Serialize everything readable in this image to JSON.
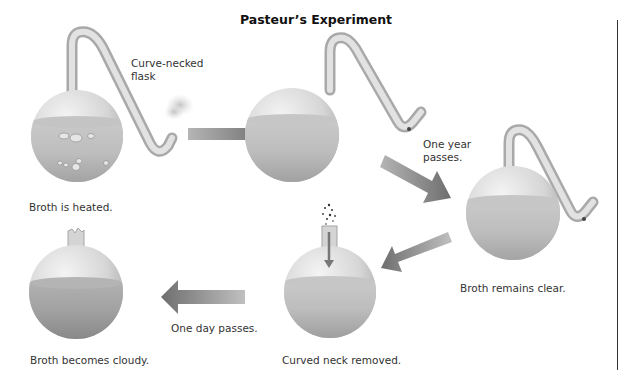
{
  "title": "Pasteur’s Experiment",
  "labels": {
    "curve_necked_1": "Curve-necked",
    "curve_necked_2": "flask",
    "broth_heated": "Broth is heated.",
    "one_year_1": "One year",
    "one_year_2": "passes.",
    "broth_clear": "Broth remains clear.",
    "neck_removed": "Curved neck removed.",
    "one_day": "One day passes.",
    "broth_cloudy": "Broth becomes cloudy."
  },
  "steps": [
    {
      "id": 1,
      "flask": "curve-necked, boiling",
      "caption": "Broth is heated."
    },
    {
      "id": 2,
      "flask": "curve-necked, clear",
      "caption": ""
    },
    {
      "id": 3,
      "flask": "curve-necked, clear",
      "caption": "Broth remains clear."
    },
    {
      "id": 4,
      "flask": "neck removed, clear",
      "caption": "Curved neck removed."
    },
    {
      "id": 5,
      "flask": "neck removed, cloudy",
      "caption": "Broth becomes cloudy."
    }
  ],
  "transitions": [
    {
      "from": 1,
      "to": 2,
      "label": ""
    },
    {
      "from": 2,
      "to": 3,
      "label": "One year passes."
    },
    {
      "from": 3,
      "to": 4,
      "label": ""
    },
    {
      "from": 4,
      "to": 5,
      "label": "One day passes."
    }
  ],
  "colors": {
    "glass": "#d9d9d9",
    "broth": "#b8b8b8",
    "arrow": "#8a8a8a",
    "text": "#333333"
  }
}
